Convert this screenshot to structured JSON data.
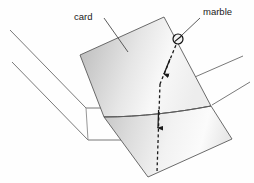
{
  "figure": {
    "background_color": "#fefefe",
    "line_color": "#4a4a4a",
    "text_color": "#1a1a1a"
  },
  "labels": {
    "card": "card",
    "marble": "marble"
  },
  "card": {
    "name": "card",
    "fill_light": "#fdfdfd",
    "fill_mid": "#d8d8d8",
    "fill_dark": "#b4b4b4",
    "stroke": "#5a5a5a"
  },
  "table": {
    "name": "table",
    "stroke": "#6a6a6a"
  },
  "marble": {
    "name": "marble",
    "stroke": "#111111",
    "radius": 5
  },
  "trajectory": {
    "name": "marble-path",
    "style": "dashed",
    "stroke": "#1a1a1a",
    "arrowheads": 2
  }
}
